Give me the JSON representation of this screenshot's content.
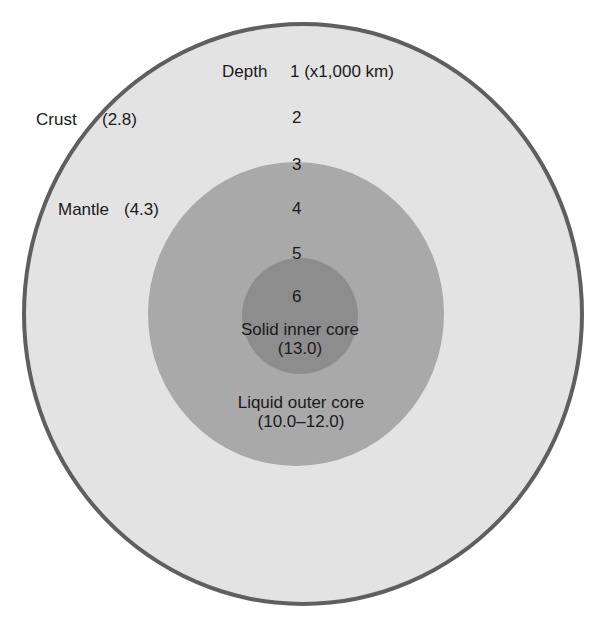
{
  "diagram": {
    "layers": [
      {
        "name": "Crust",
        "density": "(2.8)",
        "color": "#e3e3e3"
      },
      {
        "name": "Mantle",
        "density": "(4.3)",
        "color": "#e3e3e3"
      },
      {
        "name": "Liquid outer core",
        "density": "(10.0–12.0)",
        "color": "#a9a9a9"
      },
      {
        "name": "Solid inner core",
        "density": "(13.0)",
        "color": "#8d8d8d"
      }
    ],
    "depth_axis": {
      "label": "Depth",
      "ticks": [
        "1 (x1,000 km)",
        "2",
        "3",
        "4",
        "5",
        "6"
      ]
    },
    "border_color": "#5f5f5f"
  }
}
